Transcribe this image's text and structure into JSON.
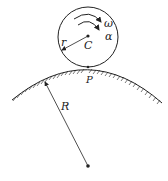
{
  "diagram": {
    "labels": {
      "omega": "ω",
      "alpha": "α",
      "center_small": "C",
      "radius_small": "r",
      "contact_point": "P",
      "radius_large": "R"
    },
    "colors": {
      "stroke": "#222222",
      "background": "#ffffff"
    }
  }
}
